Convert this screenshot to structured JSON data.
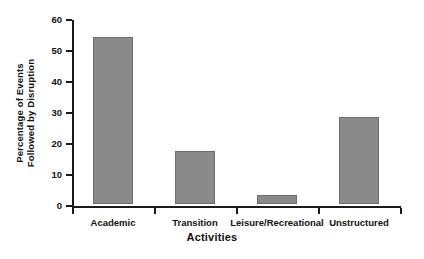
{
  "chart_data": {
    "type": "bar",
    "title": "",
    "subtitle": "",
    "xlabel": "Activities",
    "ylabel": "Percentage of Events Followed by Disruption",
    "ylabel_line1": "Percentage of Events",
    "ylabel_line2": "Followed by Disruption",
    "categories": [
      "Academic",
      "Transition",
      "Leisure/Recreational",
      "Unstructured"
    ],
    "values": [
      54,
      17,
      3,
      28
    ],
    "ylim": [
      0,
      60
    ],
    "yticks": [
      0,
      10,
      20,
      30,
      40,
      50,
      60
    ],
    "ytick_labels": [
      "0",
      "10",
      "20",
      "30",
      "40",
      "50",
      "60"
    ],
    "grid": false,
    "legend": false,
    "legend_position": "none",
    "bar_color": "#8a8a8a",
    "bar_edge_color": "#6d6d6d",
    "axis_color": "#1a1a1a",
    "background_color": "#ffffff"
  }
}
